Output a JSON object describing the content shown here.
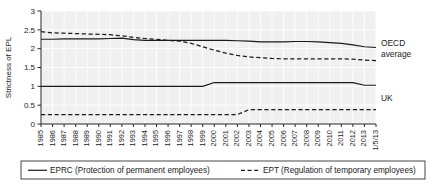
{
  "chart_data": {
    "type": "line",
    "title": "",
    "xlabel": "",
    "ylabel": "Strictness of EPL",
    "ylim": [
      0,
      3
    ],
    "yticks": [
      "0",
      "0.5",
      "1",
      "1.5",
      "2",
      "2.5",
      "3"
    ],
    "grid": true,
    "legend_position": "bottom",
    "categories": [
      "1985",
      "1986",
      "1987",
      "1988",
      "1989",
      "1990",
      "1991",
      "1992",
      "1993",
      "1994",
      "1995",
      "1996",
      "1997",
      "1998",
      "1999",
      "2000",
      "2001",
      "2002",
      "2003",
      "2004",
      "2005",
      "2006",
      "2007",
      "2008",
      "2009",
      "2010",
      "2011",
      "2012",
      "2013",
      "1/5/13"
    ],
    "series": [
      {
        "name": "OECD average EPRC",
        "style": "solid",
        "group": "OECD average",
        "values": [
          2.25,
          2.25,
          2.26,
          2.26,
          2.26,
          2.26,
          2.27,
          2.28,
          2.24,
          2.22,
          2.22,
          2.22,
          2.22,
          2.22,
          2.22,
          2.22,
          2.22,
          2.21,
          2.2,
          2.18,
          2.18,
          2.18,
          2.19,
          2.19,
          2.18,
          2.16,
          2.14,
          2.1,
          2.05,
          2.03
        ]
      },
      {
        "name": "OECD average EPT",
        "style": "dashed",
        "group": "OECD average",
        "values": [
          2.45,
          2.42,
          2.41,
          2.4,
          2.39,
          2.38,
          2.37,
          2.34,
          2.3,
          2.27,
          2.25,
          2.22,
          2.2,
          2.14,
          2.05,
          1.96,
          1.88,
          1.82,
          1.78,
          1.76,
          1.74,
          1.73,
          1.73,
          1.73,
          1.73,
          1.73,
          1.73,
          1.72,
          1.7,
          1.68
        ]
      },
      {
        "name": "UK EPRC",
        "style": "solid",
        "group": "UK",
        "values": [
          1.0,
          1.0,
          1.0,
          1.0,
          1.0,
          1.0,
          1.0,
          1.0,
          1.0,
          1.0,
          1.0,
          1.0,
          1.0,
          1.0,
          1.0,
          1.1,
          1.1,
          1.1,
          1.1,
          1.1,
          1.1,
          1.1,
          1.1,
          1.1,
          1.1,
          1.1,
          1.1,
          1.1,
          1.03,
          1.03
        ]
      },
      {
        "name": "UK EPT",
        "style": "dashed",
        "group": "UK",
        "values": [
          0.25,
          0.25,
          0.25,
          0.25,
          0.25,
          0.25,
          0.25,
          0.25,
          0.25,
          0.25,
          0.25,
          0.25,
          0.25,
          0.25,
          0.25,
          0.25,
          0.25,
          0.25,
          0.38,
          0.38,
          0.38,
          0.38,
          0.38,
          0.38,
          0.38,
          0.38,
          0.38,
          0.38,
          0.38,
          0.38
        ]
      }
    ],
    "annotations": [
      {
        "id": "oecd",
        "line1": "OECD",
        "line2": "average"
      },
      {
        "id": "uk",
        "line1": "UK",
        "line2": ""
      }
    ],
    "legend": [
      {
        "id": "eprc",
        "style": "solid",
        "label": "EPRC (Protection of permanent employees)"
      },
      {
        "id": "ept",
        "style": "dashed",
        "label": "EPT (Regulation of temporary employees)"
      }
    ],
    "colors": {
      "line": "#1a1a1a",
      "plot_background": "#f0f0f0",
      "grid": "#ffffff",
      "axis": "#262626"
    }
  }
}
